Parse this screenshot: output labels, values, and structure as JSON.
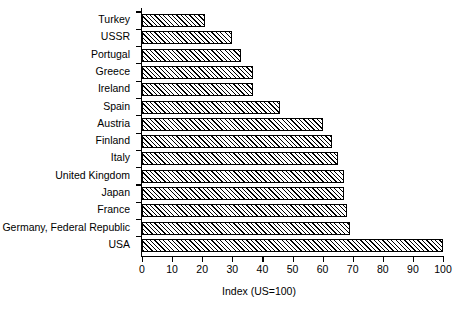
{
  "chart_data": {
    "type": "bar",
    "orientation": "horizontal",
    "title": "",
    "xlabel": "Index (US=100)",
    "ylabel": "",
    "xlim": [
      0,
      100
    ],
    "xticks": [
      0,
      10,
      20,
      30,
      40,
      50,
      60,
      70,
      80,
      90,
      100
    ],
    "xtick_labels": [
      "0",
      "10",
      "20",
      "30",
      "40",
      "50",
      "60",
      "70",
      "80",
      "90",
      "100"
    ],
    "grid": false,
    "legend": null,
    "bar_style": {
      "fill": "diagonal-hatch",
      "hatch_color": "#000000",
      "background": "#ffffff",
      "edge_color": "#000000"
    },
    "categories": [
      "Turkey",
      "USSR",
      "Portugal",
      "Greece",
      "Ireland",
      "Spain",
      "Austria",
      "Finland",
      "Italy",
      "United Kingdom",
      "Japan",
      "France",
      "Germany, Federal Republic",
      "USA"
    ],
    "values": [
      21,
      30,
      33,
      37,
      37,
      46,
      60,
      63,
      65,
      67,
      67,
      68,
      69,
      100
    ]
  }
}
